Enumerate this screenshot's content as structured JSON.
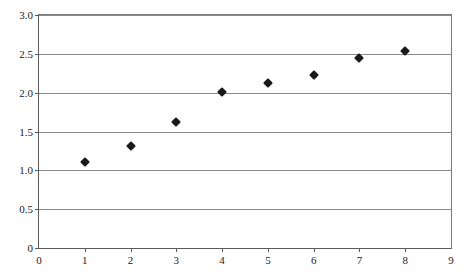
{
  "chart_data": {
    "type": "scatter",
    "title": "",
    "subtitle": "",
    "xlabel": "",
    "ylabel": "",
    "x": [
      1,
      2,
      3,
      4,
      5,
      6,
      7,
      8
    ],
    "values": [
      1.11,
      1.31,
      1.62,
      2.01,
      2.12,
      2.23,
      2.44,
      2.54
    ],
    "series": [
      {
        "name": "Series 1",
        "marker": "filled-diamond",
        "color": "#1a1a1a",
        "points": [
          {
            "x": 1,
            "y": 1.11
          },
          {
            "x": 2,
            "y": 1.31
          },
          {
            "x": 3,
            "y": 1.62
          },
          {
            "x": 4,
            "y": 2.01
          },
          {
            "x": 5,
            "y": 2.12
          },
          {
            "x": 6,
            "y": 2.23
          },
          {
            "x": 7,
            "y": 2.44
          },
          {
            "x": 8,
            "y": 2.54
          }
        ]
      }
    ],
    "xlim": [
      0,
      9
    ],
    "ylim": [
      0,
      3.0
    ],
    "xticks": [
      0,
      1,
      2,
      3,
      4,
      5,
      6,
      7,
      8,
      9
    ],
    "yticks": [
      0,
      0.5,
      1.0,
      1.5,
      2.0,
      2.5,
      3.0
    ],
    "xticklabels": [
      "0",
      "1",
      "2",
      "3",
      "4",
      "5",
      "6",
      "7",
      "8",
      "9"
    ],
    "yticklabels": [
      "0",
      "0.5",
      "1.0",
      "1.5",
      "2.0",
      "2.5",
      "3.0"
    ],
    "grid": "horizontal",
    "legend": "none",
    "annotations": [],
    "colors": {
      "marker": "#1a1a1a",
      "gridline": "#8a8a8a",
      "axis": "#5a5a5a",
      "plot_background": "#ffffff",
      "text": "#1a1a1a"
    }
  }
}
